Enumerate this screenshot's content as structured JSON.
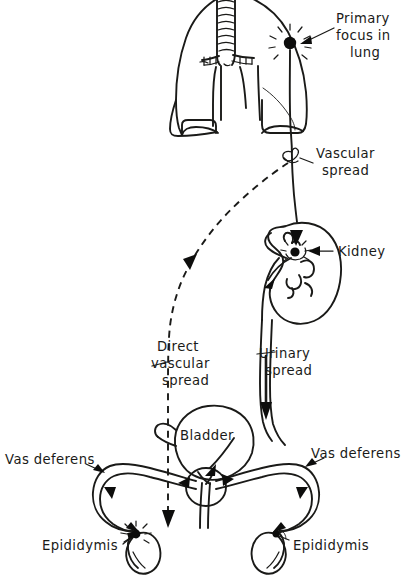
{
  "figure": {
    "background_color": "#ffffff",
    "ink_color": "#1a1a18"
  },
  "labels": {
    "primary_focus": {
      "line1": "Primary",
      "line2": "focus in",
      "line3": "lung"
    },
    "vascular_spread": {
      "line1": "Vascular",
      "line2": "spread"
    },
    "kidney": {
      "line1": "Kidney"
    },
    "direct_vascular_spread": {
      "line1": "Direct",
      "line2": "vascular",
      "line3": "spread"
    },
    "urinary_spread": {
      "line1": "Urinary",
      "line2": "spread"
    },
    "bladder": {
      "line1": "Bladder"
    },
    "vas_deferens_left": {
      "line1": "Vas deferens"
    },
    "vas_deferens_right": {
      "line1": "Vas deferens"
    },
    "epididymis_left": {
      "line1": "Epididymis"
    },
    "epididymis_right": {
      "line1": "Epididymis"
    }
  },
  "anatomy": [
    {
      "name": "trachea",
      "label": "Trachea with cartilage rings"
    },
    {
      "name": "left-lung",
      "label": "Left lung"
    },
    {
      "name": "right-lung",
      "label": "Right lung"
    },
    {
      "name": "kidney",
      "label": "Kidney with calyces and pelvis"
    },
    {
      "name": "ureter",
      "label": "Ureter"
    },
    {
      "name": "bladder",
      "label": "Bladder"
    },
    {
      "name": "prostate",
      "label": "Prostate"
    },
    {
      "name": "urethra",
      "label": "Urethra"
    },
    {
      "name": "left-testis",
      "label": "Left testis"
    },
    {
      "name": "right-testis",
      "label": "Right testis"
    },
    {
      "name": "left-vas-deferens",
      "label": "Left vas deferens"
    },
    {
      "name": "right-vas-deferens",
      "label": "Right vas deferens"
    }
  ],
  "foci": [
    {
      "name": "lung-focus",
      "label": "Primary focus in lung"
    },
    {
      "name": "kidney-focus",
      "label": "Secondary focus in kidney"
    },
    {
      "name": "epididymis-focus",
      "label": "Focus in left epididymis"
    }
  ],
  "pathways": [
    {
      "name": "vascular-spread-path",
      "style": "solid",
      "from": "lung-focus",
      "to": "kidney"
    },
    {
      "name": "direct-vascular-spread-path",
      "style": "dashed",
      "from": "vascular-spread-point",
      "to": "left-epididymis"
    },
    {
      "name": "urinary-spread-path",
      "style": "solid",
      "from": "kidney",
      "to": "bladder"
    },
    {
      "name": "vas-deferens-spread-left",
      "style": "solid",
      "from": "prostate",
      "to": "left-epididymis"
    },
    {
      "name": "vas-deferens-spread-right",
      "style": "solid",
      "from": "right-epididymis",
      "to": "prostate"
    }
  ]
}
